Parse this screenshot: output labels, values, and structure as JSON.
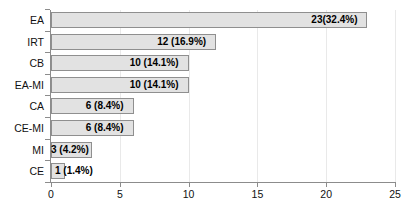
{
  "chart_data": {
    "type": "bar",
    "orientation": "horizontal",
    "title": "",
    "xlabel": "",
    "ylabel": "",
    "xlim": [
      0,
      25
    ],
    "xticks": [
      0,
      5,
      10,
      15,
      20,
      25
    ],
    "xtick_labels": [
      "0",
      "5",
      "10",
      "15",
      "20",
      "25"
    ],
    "grid": true,
    "grid_axis": "x",
    "legend": false,
    "bar_color": "#e2e2e2",
    "bar_edge_color": "#8f8f8f",
    "axis_color": "#8c8c8c",
    "label_color": "#000000",
    "categories": [
      "EA",
      "IRT",
      "CB",
      "EA-MI",
      "CA",
      "CE-MI",
      "MI",
      "CE"
    ],
    "values": [
      23,
      12,
      10,
      10,
      6,
      6,
      3,
      1
    ],
    "percentages": [
      32.4,
      16.9,
      14.1,
      14.1,
      8.4,
      8.4,
      4.2,
      1.4
    ],
    "data_labels": [
      "23(32.4%)",
      "12 (16.9%)",
      "10 (14.1%)",
      "10 (14.1%)",
      "6 (8.4%)",
      "6 (8.4%)",
      "3 (4.2%)",
      "1 (1.4%)"
    ],
    "bars": [
      {
        "category": "EA",
        "value": 23,
        "percent": 32.4,
        "label": "23(32.4%)",
        "label_inside": true
      },
      {
        "category": "IRT",
        "value": 12,
        "percent": 16.9,
        "label": "12 (16.9%)",
        "label_inside": true
      },
      {
        "category": "CB",
        "value": 10,
        "percent": 14.1,
        "label": "10 (14.1%)",
        "label_inside": true
      },
      {
        "category": "EA-MI",
        "value": 10,
        "percent": 14.1,
        "label": "10 (14.1%)",
        "label_inside": true
      },
      {
        "category": "CA",
        "value": 6,
        "percent": 8.4,
        "label": "6 (8.4%)",
        "label_inside": true
      },
      {
        "category": "CE-MI",
        "value": 6,
        "percent": 8.4,
        "label": "6 (8.4%)",
        "label_inside": true
      },
      {
        "category": "MI",
        "value": 3,
        "percent": 4.2,
        "label": "3 (4.2%)",
        "label_inside": true
      },
      {
        "category": "CE",
        "value": 1,
        "percent": 1.4,
        "label": "1 (1.4%)",
        "label_inside": false
      }
    ]
  }
}
